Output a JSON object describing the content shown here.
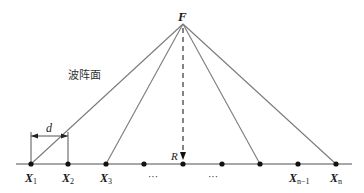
{
  "diagram": {
    "focus": {
      "label": "F",
      "x": 183,
      "y": 24
    },
    "wavefront_label": "波阵面",
    "spacing_label": "d",
    "center_label": "R",
    "baseline": {
      "x1": 16,
      "x2": 352,
      "y": 164
    },
    "points": [
      {
        "x": 31,
        "label": "X",
        "sub": "1"
      },
      {
        "x": 68,
        "label": "X",
        "sub": "2"
      },
      {
        "x": 106,
        "label": "X",
        "sub": "3"
      },
      {
        "x": 144,
        "label": "",
        "sub": ""
      },
      {
        "x": 183,
        "label": "",
        "sub": ""
      },
      {
        "x": 222,
        "label": "",
        "sub": ""
      },
      {
        "x": 260,
        "label": "",
        "sub": ""
      },
      {
        "x": 298,
        "label": "X",
        "sub": "n−1"
      },
      {
        "x": 336,
        "label": "X",
        "sub": "n"
      }
    ],
    "ellipsis_1": "···",
    "ellipsis_2": "···",
    "rays_to": [
      31,
      106,
      260,
      336
    ],
    "colors": {
      "line": "#7a7a7a",
      "dot": "#111111",
      "text": "#1a1a1a"
    }
  }
}
